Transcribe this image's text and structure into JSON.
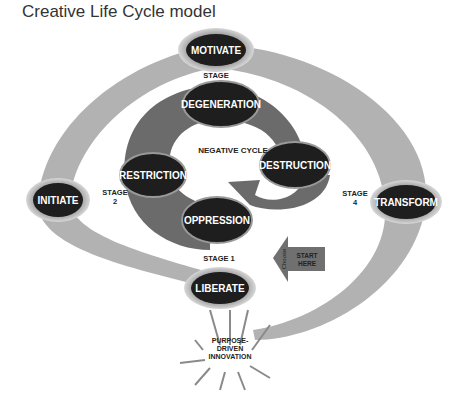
{
  "title": "Creative Life Cycle model",
  "outer_cycle": {
    "nodes": [
      {
        "id": "motivate",
        "label": "MOTIVATE"
      },
      {
        "id": "initiate",
        "label": "INITIATE"
      },
      {
        "id": "liberate",
        "label": "LIBERATE"
      },
      {
        "id": "transform",
        "label": "TRANSFORM"
      }
    ],
    "stages": [
      {
        "line1": "STAGE",
        "line2": "3"
      },
      {
        "line1": "STAGE",
        "line2": "2"
      },
      {
        "line1": "STAGE 1",
        "line2": ""
      },
      {
        "line1": "STAGE",
        "line2": "4"
      }
    ]
  },
  "negative_cycle": {
    "label": "NEGATIVE CYCLE",
    "nodes": [
      {
        "id": "degeneration",
        "label": "DEGENERATION"
      },
      {
        "id": "restriction",
        "label": "RESTRICTION"
      },
      {
        "id": "oppression",
        "label": "OPPRESSION"
      },
      {
        "id": "destruction",
        "label": "DESTRUCTION"
      }
    ]
  },
  "start_arrow": {
    "line1": "START",
    "line2": "HERE",
    "side_label": "Choose"
  },
  "burst": {
    "line1": "PURPOSE-",
    "line2": "DRIVEN",
    "line3": "INNOVATION"
  },
  "colors": {
    "band": "#b0b0b0",
    "spiral": "#6a6a6a",
    "node": "#1e1e1e",
    "arrow": "#707070"
  }
}
